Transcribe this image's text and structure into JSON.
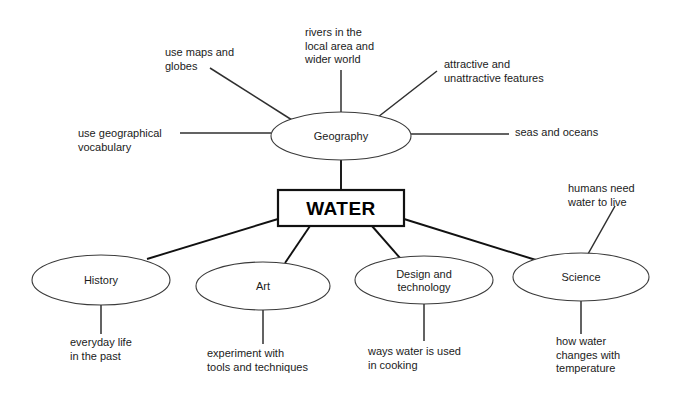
{
  "diagram": {
    "type": "mind-map",
    "title_node": "WATER",
    "center": {
      "label": "WATER",
      "shape": "rectangle",
      "x": 278,
      "y": 190,
      "w": 126,
      "h": 36
    },
    "subject_nodes": [
      {
        "id": "geography",
        "label": "Geography",
        "shape": "ellipse",
        "cx": 341,
        "cy": 136,
        "rx": 70,
        "ry": 24,
        "position": "above-center"
      },
      {
        "id": "history",
        "label": "History",
        "shape": "ellipse",
        "cx": 101,
        "cy": 280,
        "rx": 69,
        "ry": 25,
        "position": "bottom-1"
      },
      {
        "id": "art",
        "label": "Art",
        "shape": "ellipse",
        "cx": 263,
        "cy": 286,
        "rx": 67,
        "ry": 24,
        "position": "bottom-2"
      },
      {
        "id": "design-and-technology",
        "label": "Design and\ntechnology",
        "label_lines": [
          "Design and",
          "technology"
        ],
        "shape": "ellipse",
        "cx": 424,
        "cy": 280,
        "rx": 69,
        "ry": 24,
        "position": "bottom-3"
      },
      {
        "id": "science",
        "label": "Science",
        "shape": "ellipse",
        "cx": 581,
        "cy": 277,
        "rx": 68,
        "ry": 24,
        "position": "bottom-4"
      }
    ],
    "leaf_notes": [
      {
        "id": "use-maps-and-globes",
        "parent": "geography",
        "lines": [
          "use maps and",
          "globes"
        ],
        "x": 165,
        "y": 56,
        "anchor": "start"
      },
      {
        "id": "rivers-in-the-local-area-and-wider-world",
        "parent": "geography",
        "lines": [
          "rivers in the",
          "local area and",
          "wider world"
        ],
        "x": 305,
        "y": 36,
        "anchor": "start"
      },
      {
        "id": "attractive-and-unattractive-features",
        "parent": "geography",
        "lines": [
          "attractive and",
          "unattractive features"
        ],
        "x": 444,
        "y": 68,
        "anchor": "start"
      },
      {
        "id": "seas-and-oceans",
        "parent": "geography",
        "lines": [
          "seas and oceans"
        ],
        "x": 515,
        "y": 136,
        "anchor": "start"
      },
      {
        "id": "use-geographical-vocabulary",
        "parent": "geography",
        "lines": [
          "use geographical",
          "vocabulary"
        ],
        "x": 78,
        "y": 137,
        "anchor": "start"
      },
      {
        "id": "everyday-life-in-the-past",
        "parent": "history",
        "lines": [
          "everyday life",
          "in the past"
        ],
        "x": 70,
        "y": 346,
        "anchor": "start"
      },
      {
        "id": "experiment-with-tools-and-techniques",
        "parent": "art",
        "lines": [
          "experiment with",
          "tools and techniques"
        ],
        "x": 207,
        "y": 357,
        "anchor": "start"
      },
      {
        "id": "ways-water-is-used-in-cooking",
        "parent": "design-and-technology",
        "lines": [
          "ways water is used",
          "in cooking"
        ],
        "x": 368,
        "y": 355,
        "anchor": "start"
      },
      {
        "id": "how-water-changes-with-temperature",
        "parent": "science",
        "lines": [
          "how water",
          "changes with",
          "temperature"
        ],
        "x": 556,
        "y": 345,
        "anchor": "start"
      },
      {
        "id": "humans-need-water-to-live",
        "parent": "science",
        "lines": [
          "humans need",
          "water to live"
        ],
        "x": 568,
        "y": 192,
        "anchor": "start"
      }
    ],
    "connectors": [
      {
        "id": "geography-to-water",
        "from": "geography",
        "to": "center",
        "x1": 341,
        "y1": 160,
        "x2": 341,
        "y2": 190
      },
      {
        "id": "water-to-history",
        "from": "center",
        "to": "history",
        "x1": 278,
        "y1": 219,
        "x2": 147,
        "y2": 259
      },
      {
        "id": "water-to-art",
        "from": "center",
        "to": "art",
        "x1": 310,
        "y1": 226,
        "x2": 285,
        "y2": 263
      },
      {
        "id": "water-to-design",
        "from": "center",
        "to": "design-and-technology",
        "x1": 372,
        "y1": 226,
        "x2": 400,
        "y2": 258
      },
      {
        "id": "water-to-science",
        "from": "center",
        "to": "science",
        "x1": 404,
        "y1": 219,
        "x2": 536,
        "y2": 260
      },
      {
        "id": "geography-to-maps",
        "from": "geography",
        "to": "use-maps-and-globes",
        "x1": 292,
        "y1": 120,
        "x2": 210,
        "y2": 68
      },
      {
        "id": "geography-to-rivers",
        "from": "geography",
        "to": "rivers-in-the-local-area-and-wider-world",
        "x1": 341,
        "y1": 112,
        "x2": 341,
        "y2": 70
      },
      {
        "id": "geography-to-attractive",
        "from": "geography",
        "to": "attractive-and-unattractive-features",
        "x1": 378,
        "y1": 117,
        "x2": 437,
        "y2": 71
      },
      {
        "id": "geography-to-seas",
        "from": "geography",
        "to": "seas-and-oceans",
        "x1": 411,
        "y1": 134,
        "x2": 509,
        "y2": 134
      },
      {
        "id": "geography-to-vocabulary",
        "from": "geography",
        "to": "use-geographical-vocabulary",
        "x1": 271,
        "y1": 133,
        "x2": 180,
        "y2": 133
      },
      {
        "id": "history-to-everyday",
        "from": "history",
        "to": "everyday-life-in-the-past",
        "x1": 101,
        "y1": 305,
        "x2": 101,
        "y2": 334
      },
      {
        "id": "art-to-experiment",
        "from": "art",
        "to": "experiment-with-tools-and-techniques",
        "x1": 263,
        "y1": 310,
        "x2": 263,
        "y2": 344
      },
      {
        "id": "design-to-cooking",
        "from": "design-and-technology",
        "to": "ways-water-is-used-in-cooking",
        "x1": 424,
        "y1": 304,
        "x2": 424,
        "y2": 341
      },
      {
        "id": "science-to-temperature",
        "from": "science",
        "to": "how-water-changes-with-temperature",
        "x1": 581,
        "y1": 301,
        "x2": 581,
        "y2": 334
      },
      {
        "id": "science-to-humans",
        "from": "science",
        "to": "humans-need-water-to-live",
        "x1": 588,
        "y1": 254,
        "x2": 615,
        "y2": 206
      }
    ],
    "colors": {
      "background": "#ffffff",
      "node_stroke": "#3a3a3a",
      "center_stroke": "#111111",
      "edge": "#111111",
      "text": "#1b1b1b"
    }
  }
}
